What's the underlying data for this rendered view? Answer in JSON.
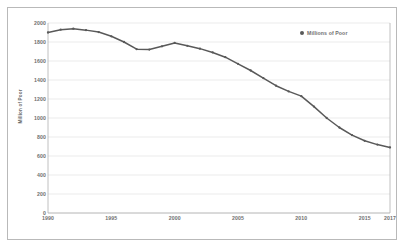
{
  "chart_data": {
    "type": "line",
    "title": "",
    "xlabel": "",
    "ylabel": "Million of Poor",
    "legend": [
      "Millions of Poor"
    ],
    "legend_position": "top-right",
    "grid": true,
    "xlim": [
      1990,
      2017
    ],
    "ylim": [
      0,
      2000
    ],
    "ytick_labels": [
      "2000",
      "1800",
      "1600",
      "1400",
      "1200",
      "1000",
      "800",
      "600",
      "400",
      "200",
      "0"
    ],
    "ytick_values": [
      2000,
      1800,
      1600,
      1400,
      1200,
      1000,
      800,
      600,
      400,
      200,
      0
    ],
    "xtick_labels": [
      "1990",
      "1995",
      "2000",
      "2005",
      "2010",
      "2015",
      "2017"
    ],
    "xtick_values": [
      1990,
      1995,
      2000,
      2005,
      2010,
      2015,
      2017
    ],
    "x": [
      1990,
      1991,
      1992,
      1993,
      1994,
      1995,
      1996,
      1997,
      1998,
      1999,
      2000,
      2001,
      2002,
      2003,
      2004,
      2005,
      2006,
      2007,
      2008,
      2009,
      2010,
      2011,
      2012,
      2013,
      2014,
      2015,
      2016,
      2017
    ],
    "series": [
      {
        "name": "Millions of Poor",
        "color": "#595959",
        "marker": "circle",
        "values": [
          1900,
          1930,
          1940,
          1925,
          1905,
          1860,
          1800,
          1725,
          1720,
          1755,
          1790,
          1760,
          1730,
          1690,
          1640,
          1570,
          1500,
          1420,
          1340,
          1280,
          1230,
          1120,
          1000,
          900,
          820,
          760,
          720,
          690
        ]
      }
    ]
  },
  "axis": {
    "y_title": "Million of Poor"
  },
  "legend": {
    "entries": [
      {
        "label": "Millions of Poor",
        "color": "#595959",
        "marker": "circle-marker"
      }
    ]
  },
  "colors": {
    "line": "#595959",
    "grid": "#e3e3e3",
    "axis": "#b0b0b0",
    "text": "#6f6f6f",
    "border": "#b9b9b9",
    "background": "#ffffff"
  }
}
